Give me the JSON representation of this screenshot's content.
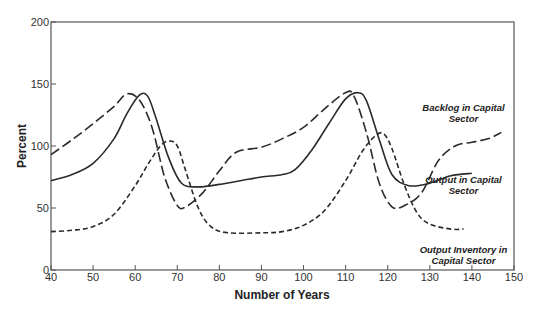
{
  "chart_data": {
    "type": "line",
    "title": "",
    "xlabel": "Number of Years",
    "ylabel": "Percent",
    "xlim": [
      40,
      150
    ],
    "ylim": [
      0,
      200
    ],
    "xticks": [
      40,
      50,
      60,
      70,
      80,
      90,
      100,
      110,
      120,
      130,
      140,
      150
    ],
    "yticks": [
      0,
      50,
      100,
      150,
      200
    ],
    "grid": false,
    "legend": "inline labels at right",
    "series": [
      {
        "name": "Backlog in Capital Sector",
        "style": "long-dash",
        "x": [
          40,
          45,
          50,
          55,
          58,
          61,
          64,
          67,
          70,
          72,
          76,
          80,
          84,
          90,
          95,
          100,
          105,
          110,
          112,
          115,
          118,
          121,
          124,
          128,
          132,
          136,
          140,
          144,
          147
        ],
        "y": [
          93,
          105,
          118,
          132,
          142,
          137,
          115,
          75,
          52,
          51,
          62,
          80,
          95,
          99,
          106,
          115,
          130,
          143,
          140,
          110,
          70,
          51,
          52,
          62,
          88,
          100,
          103,
          106,
          111
        ]
      },
      {
        "name": "Output in Capital Sector",
        "style": "solid",
        "x": [
          40,
          45,
          50,
          55,
          58,
          61,
          63,
          65,
          68,
          71,
          75,
          80,
          85,
          90,
          95,
          98,
          102,
          106,
          110,
          113,
          115,
          118,
          121,
          125,
          130,
          135,
          140
        ],
        "y": [
          72,
          77,
          86,
          106,
          126,
          141,
          140,
          122,
          90,
          70,
          67,
          69,
          72,
          75,
          77,
          81,
          97,
          118,
          138,
          143,
          136,
          105,
          77,
          68,
          70,
          76,
          78
        ]
      },
      {
        "name": "Output Inventory in Capital Sector",
        "style": "short-dash",
        "x": [
          40,
          45,
          50,
          55,
          60,
          63,
          66,
          68,
          70,
          72,
          75,
          78,
          82,
          90,
          95,
          100,
          105,
          110,
          114,
          117,
          119,
          121,
          124,
          127,
          130,
          135,
          138
        ],
        "y": [
          31,
          32,
          35,
          45,
          68,
          85,
          100,
          104,
          100,
          80,
          50,
          35,
          30,
          30,
          31,
          36,
          48,
          72,
          96,
          108,
          110,
          98,
          68,
          46,
          37,
          33,
          33
        ]
      }
    ],
    "annotations": [
      {
        "text_lines": [
          "Backlog in Capital",
          "Sector"
        ],
        "x": 138,
        "y": 128
      },
      {
        "text_lines": [
          "Output in Capital",
          "Sector"
        ],
        "x": 138,
        "y": 70
      },
      {
        "text_lines": [
          "Output Inventory in",
          "Capital Sector"
        ],
        "x": 138,
        "y": 14
      }
    ]
  }
}
